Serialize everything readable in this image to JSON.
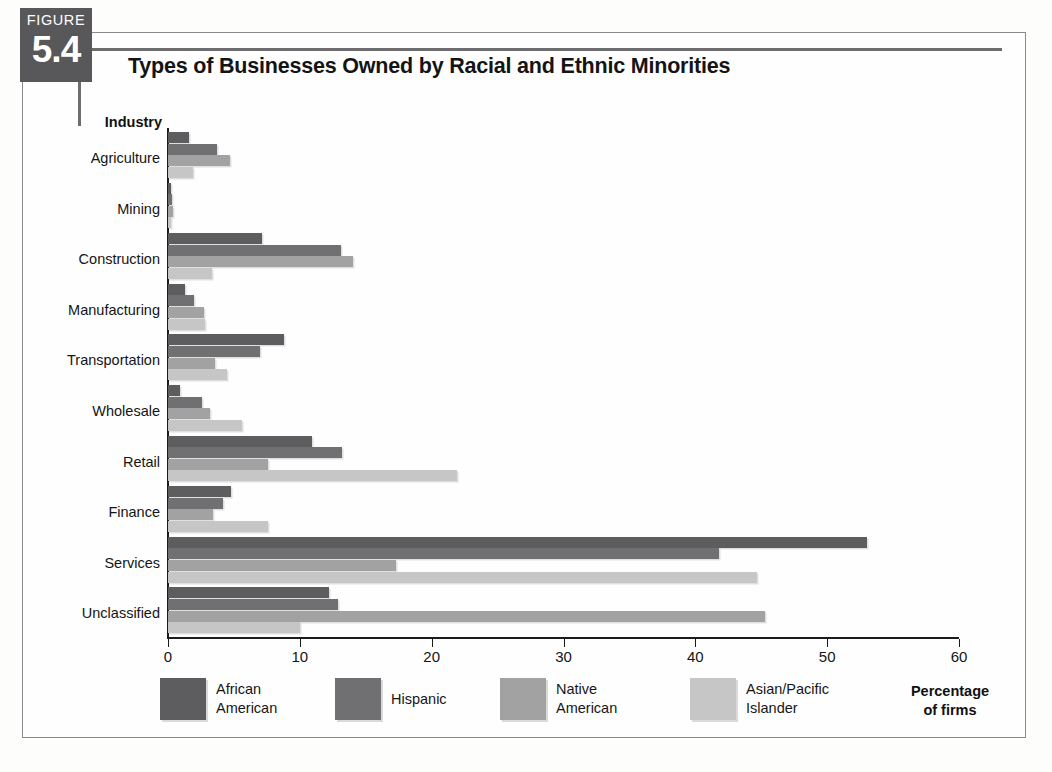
{
  "figure": {
    "word": "FIGURE",
    "number": "5.4"
  },
  "title": "Types of Businesses Owned by Racial and Ethnic Minorities",
  "axis_header": "Industry",
  "axis_caption_line1": "Percentage",
  "axis_caption_line2": "of firms",
  "colors": {
    "african_american": "#5d5d5f",
    "hispanic": "#707072",
    "native_american": "#a2a2a2",
    "asian_pacific_islander": "#c6c6c6",
    "axis": "#1c1c1c",
    "badge": "#58585a",
    "frame": "#8a8a8a"
  },
  "legend": [
    {
      "label_line1": "African",
      "label_line2": "American",
      "color_key": "african_american"
    },
    {
      "label_line1": "Hispanic",
      "label_line2": "",
      "color_key": "hispanic"
    },
    {
      "label_line1": "Native",
      "label_line2": "American",
      "color_key": "native_american"
    },
    {
      "label_line1": "Asian/Pacific",
      "label_line2": "Islander",
      "color_key": "asian_pacific_islander"
    }
  ],
  "chart_data": {
    "type": "bar",
    "orientation": "horizontal",
    "title": "Types of Businesses Owned by Racial and Ethnic Minorities",
    "xlabel": "Percentage of firms",
    "ylabel": "Industry",
    "xlim": [
      0,
      60
    ],
    "xticks": [
      0,
      10,
      20,
      30,
      40,
      50,
      60
    ],
    "grid": false,
    "legend_position": "bottom",
    "categories": [
      "Agriculture",
      "Mining",
      "Construction",
      "Manufacturing",
      "Transportation",
      "Wholesale",
      "Retail",
      "Finance",
      "Services",
      "Unclassified"
    ],
    "series": [
      {
        "name": "African American",
        "color": "#5d5d5f",
        "values": [
          1.6,
          0.2,
          7.1,
          1.3,
          8.8,
          0.9,
          10.9,
          4.8,
          53.0,
          12.2
        ]
      },
      {
        "name": "Hispanic",
        "color": "#707072",
        "values": [
          3.7,
          0.3,
          13.1,
          2.0,
          7.0,
          2.6,
          13.2,
          4.2,
          41.8,
          12.9
        ]
      },
      {
        "name": "Native American",
        "color": "#a2a2a2",
        "values": [
          4.7,
          0.4,
          14.0,
          2.7,
          3.6,
          3.2,
          7.6,
          3.4,
          17.3,
          45.3
        ]
      },
      {
        "name": "Asian/Pacific Islander",
        "color": "#c6c6c6",
        "values": [
          1.9,
          0.2,
          3.3,
          2.8,
          4.5,
          5.6,
          21.9,
          7.6,
          44.7,
          10.0
        ]
      }
    ]
  }
}
